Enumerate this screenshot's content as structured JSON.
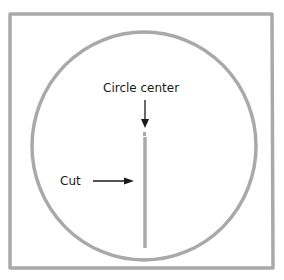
{
  "diagram": {
    "labels": {
      "center": "Circle center",
      "cut": "Cut"
    },
    "colors": {
      "shape_stroke": "#a9a9a9",
      "arrow": "#1a1a1a",
      "text": "#1a1a1a",
      "background": "#ffffff"
    }
  }
}
